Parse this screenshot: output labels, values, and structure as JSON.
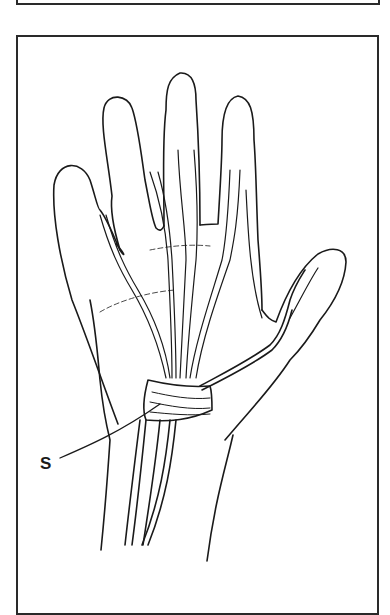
{
  "figure": {
    "labels": [
      {
        "text": "S",
        "points_to": "structure at the wrist/base of palm"
      }
    ]
  },
  "colors": {
    "line": "#1a1a1a",
    "background": "#ffffff",
    "frame": "#2a2a2a"
  }
}
